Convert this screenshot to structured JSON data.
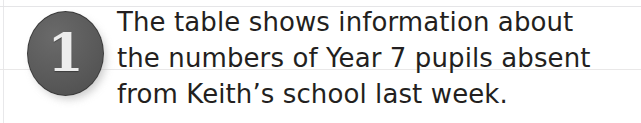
{
  "page": {
    "background_color": "#ffffff",
    "width": 641,
    "height": 123
  },
  "question": {
    "number": "1",
    "badge": {
      "shape": "circle",
      "fill_color": "#5b5b5b",
      "number_color": "#ededed"
    },
    "text_color": "#231f20",
    "lines": [
      "The table shows information about",
      "the numbers of Year 7 pupils absent",
      "from Keith’s school last week."
    ],
    "full_text": "The table shows information about the numbers of Year 7 pupils absent from Keith’s school last week."
  },
  "rules": {
    "color": "#e4e4e6"
  }
}
